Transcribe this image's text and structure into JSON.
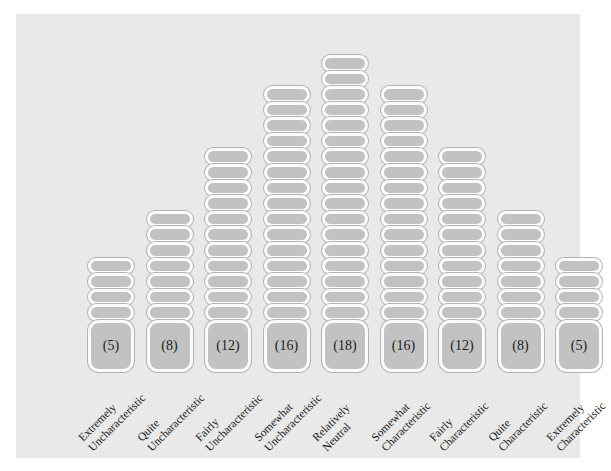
{
  "chart_data": {
    "type": "bar",
    "title": "",
    "subtitle": "",
    "xlabel": "",
    "ylabel": "",
    "categories": [
      "Extremely Uncharacteristic",
      "Quite Uncharacteristic",
      "Fairly Uncharacteristic",
      "Somewhat Uncharacteristic",
      "Relatively Neutral",
      "Somewhat Characteristic",
      "Fairly Characteristic",
      "Quite Characteristic",
      "Extremely Characteristic"
    ],
    "values": [
      5,
      8,
      12,
      16,
      18,
      16,
      12,
      8,
      5
    ],
    "value_labels": [
      "(5)",
      "(8)",
      "(12)",
      "(16)",
      "(18)",
      "(16)",
      "(12)",
      "(8)",
      "(5)"
    ],
    "ylim": [
      0,
      18
    ],
    "grid": false,
    "legend": null,
    "series": [
      {
        "name": "Q-sort card count",
        "values": [
          5,
          8,
          12,
          16,
          18,
          16,
          12,
          8,
          5
        ]
      }
    ],
    "columns": [
      {
        "index": 1,
        "count": 5,
        "label_line1": "Extremely",
        "label_line2": "Uncharacteristic",
        "value_label": "(5)"
      },
      {
        "index": 2,
        "count": 8,
        "label_line1": "Quite",
        "label_line2": "Uncharacteristic",
        "value_label": "(8)"
      },
      {
        "index": 3,
        "count": 12,
        "label_line1": "Fairly",
        "label_line2": "Uncharacteristic",
        "value_label": "(12)"
      },
      {
        "index": 4,
        "count": 16,
        "label_line1": "Somewhat",
        "label_line2": "Uncharacteristic",
        "value_label": "(16)"
      },
      {
        "index": 5,
        "count": 18,
        "label_line1": "Relatively",
        "label_line2": "Neutral",
        "value_label": "(18)"
      },
      {
        "index": 6,
        "count": 16,
        "label_line1": "Somewhat",
        "label_line2": "Characteristic",
        "value_label": "(16)"
      },
      {
        "index": 7,
        "count": 12,
        "label_line1": "Fairly",
        "label_line2": "Characteristic",
        "value_label": "(12)"
      },
      {
        "index": 8,
        "count": 8,
        "label_line1": "Quite",
        "label_line2": "Characteristic",
        "value_label": "(8)"
      },
      {
        "index": 9,
        "count": 5,
        "label_line1": "Extremely",
        "label_line2": "Characteristic",
        "value_label": "(5)"
      }
    ]
  },
  "colors": {
    "panel_background": "#e9e9e9",
    "card_fill": "#c2c2c2",
    "card_border": "#fbfbfb",
    "card_hairline": "#b3b3b3",
    "text": "#161616",
    "page_background": "#ffffff"
  }
}
